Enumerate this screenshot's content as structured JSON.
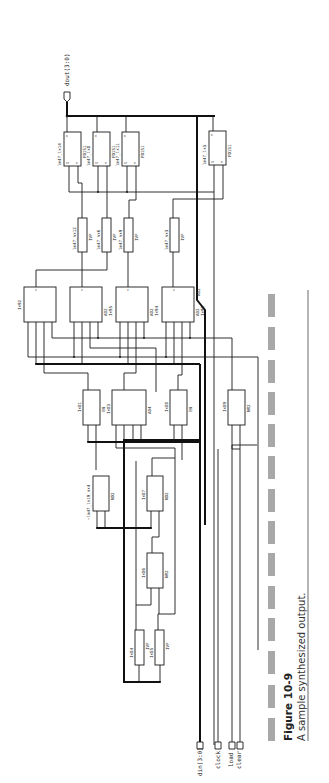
{
  "figure": {
    "number": "Figure 10-9",
    "caption": "A sample synthesized output.",
    "orientation": "rotated-90-ccw"
  },
  "ports": {
    "output": {
      "label": "dout(3:0)"
    },
    "inputs": [
      {
        "label": "din(3:0)"
      },
      {
        "label": "clock"
      },
      {
        "label": "load"
      },
      {
        "label": "clear"
      }
    ]
  },
  "flipflops": [
    {
      "instance": "lm47_lx14",
      "cell": "FD1S1",
      "pins": [
        "D",
        "CP",
        "Q"
      ]
    },
    {
      "instance": "lm47_lx8",
      "cell": "FD1S1",
      "pins": [
        "D",
        "CP",
        "Q"
      ]
    },
    {
      "instance": "lm47_lx11",
      "cell": "FD1S1",
      "pins": [
        "D",
        "CP",
        "Q"
      ]
    },
    {
      "instance": "lm47_lx5",
      "cell": "FD1S1",
      "pins": [
        "D",
        "CP",
        "Q"
      ]
    }
  ],
  "muxes": [
    {
      "instance": "lm47_nx12",
      "cell": "IVP"
    },
    {
      "instance": "lm47_nx6",
      "cell": "IVP"
    },
    {
      "instance": "lm47_nx9",
      "cell": "IVP"
    },
    {
      "instance": "lm47_nx3",
      "cell": "IVP"
    }
  ],
  "ao_gates": [
    {
      "instance": "Ix92",
      "cell": "AO2"
    },
    {
      "instance": "Ix95",
      "cell": "AO2"
    },
    {
      "instance": "Ix94",
      "cell": "AO2"
    },
    {
      "instance": "Ix90",
      "cell": "AO2"
    }
  ],
  "mid_gates": [
    {
      "instance": "Ix81",
      "cell": "EN"
    },
    {
      "instance": "Ix83",
      "cell": "AO4"
    },
    {
      "instance": "Ix88",
      "cell": "EN"
    },
    {
      "instance": "Ix89",
      "cell": "NR2"
    }
  ],
  "nor_gates": [
    {
      "instance": "~lm47_lx19_nx4",
      "cell": "ND2"
    },
    {
      "instance": "Ix87",
      "cell": "ND2"
    },
    {
      "instance": "Ix86",
      "cell": "NR2"
    }
  ],
  "inverters": [
    {
      "instance": "Ix84",
      "cell": "IVP"
    },
    {
      "instance": "Ix85",
      "cell": "IVP"
    }
  ],
  "colors": {
    "ink": "#1a1a1a",
    "dash_bar": "#a8a8a8",
    "paper": "#ffffff"
  }
}
